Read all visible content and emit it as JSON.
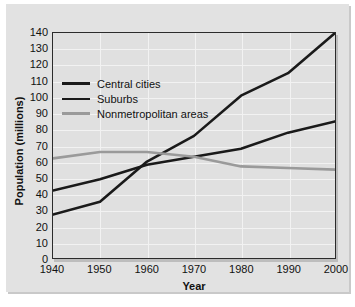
{
  "chart_data": {
    "type": "line",
    "title": "",
    "xlabel": "Year",
    "ylabel": "Population (millions)",
    "xlim": [
      1940,
      2000
    ],
    "ylim": [
      0,
      140
    ],
    "xticks": [
      1940,
      1950,
      1960,
      1970,
      1980,
      1990,
      2000
    ],
    "yticks": [
      0,
      10,
      20,
      30,
      40,
      50,
      60,
      70,
      80,
      90,
      100,
      110,
      120,
      130,
      140
    ],
    "grid": true,
    "legend_position": "upper-left-inside",
    "x": [
      1940,
      1950,
      1960,
      1970,
      1980,
      1990,
      2000
    ],
    "series": [
      {
        "name": "Central cities",
        "color": "#1a1a1a",
        "values": [
          42,
          49,
          58,
          63,
          68,
          78,
          85
        ]
      },
      {
        "name": "Suburbs",
        "color": "#1a1a1a",
        "values": [
          27,
          35,
          60,
          76,
          101,
          115,
          140
        ]
      },
      {
        "name": "Nonmetropolitan areas",
        "color": "#9a9a9a",
        "values": [
          62,
          66,
          66,
          63,
          57,
          56,
          55
        ]
      }
    ]
  },
  "axes": {
    "y_tick_labels": [
      "140",
      "130",
      "120",
      "110",
      "100",
      "90",
      "80",
      "70",
      "60",
      "50",
      "40",
      "30",
      "20",
      "10",
      "0"
    ],
    "x_tick_labels": [
      "1940",
      "1950",
      "1960",
      "1970",
      "1980",
      "1990",
      "2000"
    ],
    "x_axis_title": "Year",
    "y_axis_title": "Population (millions)"
  },
  "legend": {
    "entries": [
      {
        "label": "Central cities",
        "color": "#1a1a1a",
        "thickness": "3px"
      },
      {
        "label": "Suburbs",
        "color": "#1a1a1a",
        "thickness": "2px"
      },
      {
        "label": "Nonmetropolitan areas",
        "color": "#9a9a9a",
        "thickness": "3px"
      }
    ]
  },
  "colors": {
    "page_background": "#ffffff",
    "frame_background": "#e2e2e2",
    "plot_background": "#e0e0e0",
    "plot_border": "#2b2b2b",
    "gridline": "#f2f2f2",
    "dark_series": "#1a1a1a",
    "gray_series": "#9a9a9a"
  }
}
